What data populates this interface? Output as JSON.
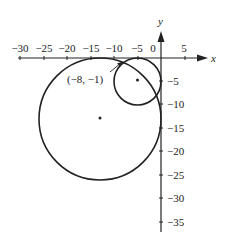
{
  "diagram": {
    "axes": {
      "x_label": "x",
      "y_label": "y",
      "x_ticks": [
        "−30",
        "−25",
        "−20",
        "−15",
        "−10",
        "−5",
        "0",
        "5"
      ],
      "x_tick_values": [
        -30,
        -25,
        -20,
        -15,
        -10,
        -5,
        0,
        5
      ],
      "y_ticks": [
        "−5",
        "−10",
        "−15",
        "−20",
        "−25",
        "−30",
        "−35"
      ],
      "y_tick_values": [
        -5,
        -10,
        -15,
        -20,
        -25,
        -30,
        -35
      ]
    },
    "circles": [
      {
        "name": "small-circle",
        "center": [
          -5,
          -5
        ],
        "radius": 5
      },
      {
        "name": "large-circle",
        "center": [
          -13,
          -13
        ],
        "radius": 13
      }
    ],
    "point_label": "(−8, −1)",
    "point": [
      -8,
      -1
    ],
    "colors": {
      "ink": "#222222",
      "background": "#ffffff"
    }
  }
}
